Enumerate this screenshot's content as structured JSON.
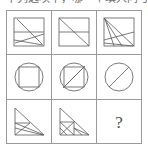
{
  "caption": {
    "text": "下列选项中，哪一个填入问号处最合适",
    "color": "#6a6a6a"
  },
  "matrix": {
    "name": "figure-reasoning-matrix",
    "rows": 3,
    "cols": 3,
    "border_color": "#9a9a9a",
    "figure_color": "#5a5a5a",
    "background": "#ffffff",
    "cells": [
      {
        "index": 1,
        "position": "row1-col1",
        "shape": "rectangle",
        "description": "Rectangle with one horizontal chord and two crossing diagonals",
        "label": ""
      },
      {
        "index": 2,
        "position": "row1-col2",
        "shape": "square",
        "description": "Square split by a horizontal midline with a full corner-to-corner diagonal",
        "label": ""
      },
      {
        "index": 3,
        "position": "row1-col3",
        "shape": "square",
        "description": "Square with a fan of diagonals radiating from the top-left corner",
        "label": ""
      },
      {
        "index": 4,
        "position": "row2-col1",
        "shape": "circle",
        "description": "Circle with an inscribed square",
        "label": ""
      },
      {
        "index": 5,
        "position": "row2-col2",
        "shape": "circle",
        "description": "Circle with an inscribed square and one diagonal of that square",
        "label": ""
      },
      {
        "index": 6,
        "position": "row2-col3",
        "shape": "circle",
        "description": "Circle crossed by a single diagonal chord",
        "label": ""
      },
      {
        "index": 7,
        "position": "row3-col1",
        "shape": "right-triangle",
        "description": "Right triangle with a horizontal chord and two internal diagonals",
        "label": ""
      },
      {
        "index": 8,
        "position": "row3-col2",
        "shape": "right-triangle",
        "description": "Right triangle subdivided into smaller triangles with a crossed square",
        "label": ""
      },
      {
        "index": 9,
        "position": "row3-col3",
        "shape": "unknown",
        "description": "Missing tile marked with a question mark",
        "label": "?"
      }
    ]
  }
}
